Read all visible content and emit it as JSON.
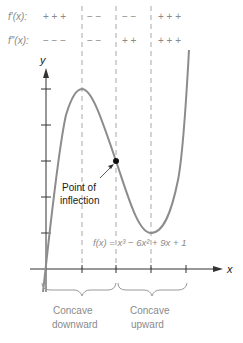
{
  "sign_chart": {
    "first_derivative": {
      "label": "f′(x):",
      "segments": [
        "+ + +",
        "− −",
        "− −",
        "+ + +"
      ]
    },
    "second_derivative": {
      "label": "f″(x):",
      "segments": [
        "− − −",
        "− −",
        "+ +",
        "+ + +"
      ]
    }
  },
  "axes": {
    "x_label": "x",
    "y_label": "y"
  },
  "annotation": {
    "line1": "Point of",
    "line2": "inflection"
  },
  "function_label": "f(x) = x³ − 6x² + 9x + 1",
  "intervals": [
    {
      "line1": "Concave",
      "line2": "downward"
    },
    {
      "line1": "Concave",
      "line2": "upward"
    }
  ],
  "colors": {
    "curve": "#8c8c8c",
    "text": "#8a8a8a",
    "axis": "#333333",
    "dashed": "#aaaaaa"
  }
}
